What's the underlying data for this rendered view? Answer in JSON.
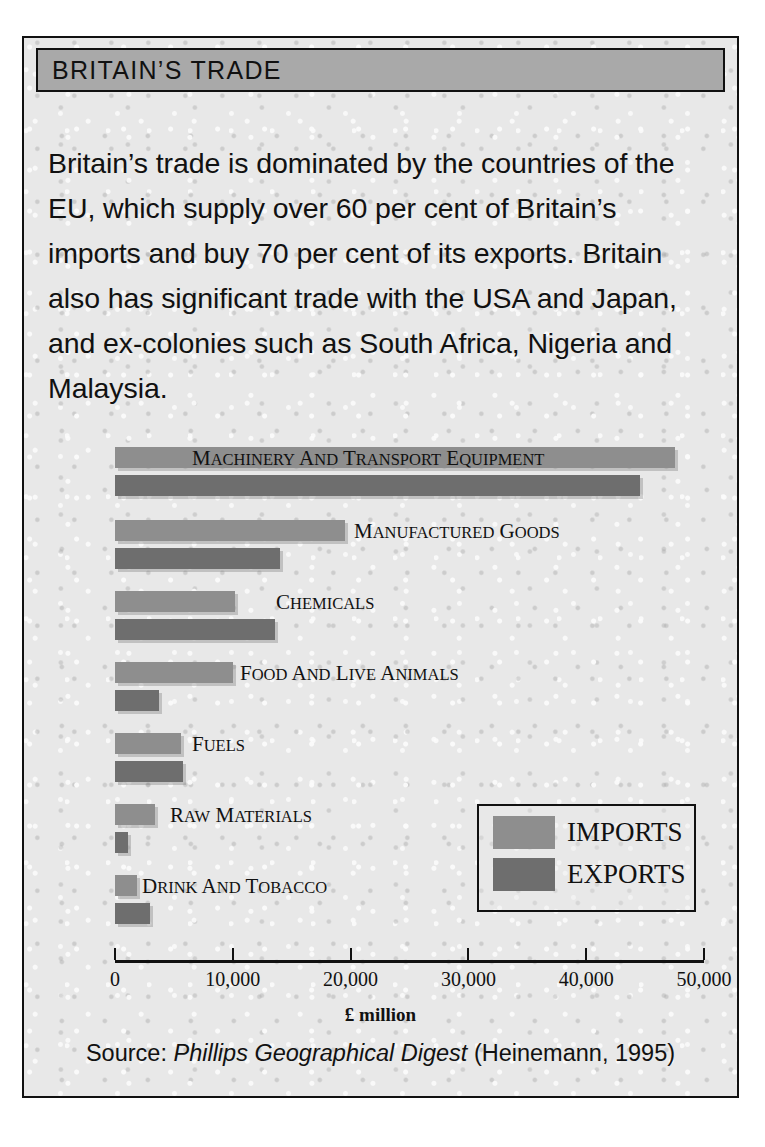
{
  "card": {
    "title": "BRITAIN’S TRADE",
    "intro": "Britain’s trade is dominated by the countries of the EU, which supply over 60 per cent of Britain’s imports and buy 70 per cent of its exports. Britain also has significant trade with the USA and Japan, and ex-colonies such as South Africa, Nigeria and Malaysia.",
    "source_prefix": "Source: ",
    "source_title": "Phillips Geographical Digest",
    "source_suffix": " (Heinemann, 1995)"
  },
  "legend": {
    "imports_label": "IMPORTS",
    "exports_label": "EXPORTS",
    "imports_color": "#8e8e8e",
    "exports_color": "#6e6e6e"
  },
  "chart_data": {
    "type": "bar",
    "orientation": "horizontal",
    "title": "",
    "xlabel": "£ million",
    "ylabel": "",
    "xlim": [
      0,
      50000
    ],
    "xticks": [
      0,
      10000,
      20000,
      30000,
      40000,
      50000
    ],
    "xtick_labels": [
      "0",
      "10,000",
      "20,000",
      "30,000",
      "40,000",
      "50,000"
    ],
    "grid": false,
    "legend_position": "middle-right",
    "categories": [
      "Machinery and transport equipment",
      "Manufactured goods",
      "Chemicals",
      "Food and live animals",
      "Fuels",
      "Raw materials",
      "Drink and tobacco"
    ],
    "series": [
      {
        "name": "IMPORTS",
        "color": "#8e8e8e",
        "values": [
          47500,
          19500,
          10200,
          10000,
          5600,
          3400,
          1900
        ]
      },
      {
        "name": "EXPORTS",
        "color": "#6e6e6e",
        "values": [
          44600,
          14000,
          13600,
          3700,
          5800,
          1100,
          3000
        ]
      }
    ]
  }
}
